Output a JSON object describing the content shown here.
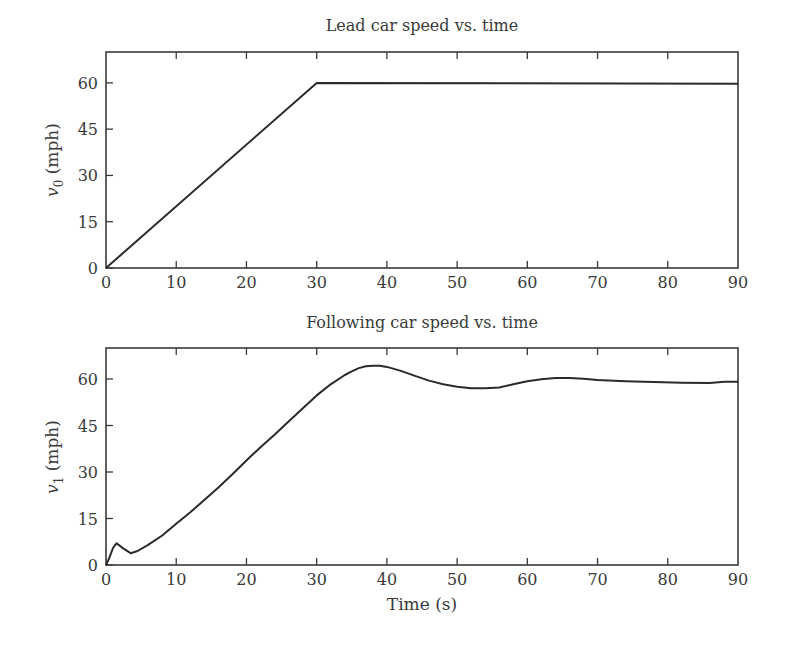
{
  "chart_data": [
    {
      "type": "line",
      "title": "Lead car speed vs. time",
      "xlabel": "",
      "ylabel": "v0 (mph)",
      "ylabel_main": "v",
      "ylabel_sub": "0",
      "ylabel_unit": "(mph)",
      "xlim": [
        0,
        90
      ],
      "ylim": [
        0,
        70
      ],
      "xticks": [
        0,
        10,
        20,
        30,
        40,
        50,
        60,
        70,
        80,
        90
      ],
      "yticks": [
        0,
        15,
        30,
        45,
        60
      ],
      "grid": false,
      "legend": null,
      "series": [
        {
          "name": "v0",
          "x": [
            0,
            30,
            90
          ],
          "y": [
            0,
            60,
            59.7
          ]
        }
      ]
    },
    {
      "type": "line",
      "title": "Following car speed vs. time",
      "xlabel": "Time (s)",
      "ylabel": "v1 (mph)",
      "ylabel_main": "v",
      "ylabel_sub": "1",
      "ylabel_unit": "(mph)",
      "xlim": [
        0,
        90
      ],
      "ylim": [
        0,
        70
      ],
      "xticks": [
        0,
        10,
        20,
        30,
        40,
        50,
        60,
        70,
        80,
        90
      ],
      "yticks": [
        0,
        15,
        30,
        45,
        60
      ],
      "grid": false,
      "legend": null,
      "series": [
        {
          "name": "v1",
          "x": [
            0,
            0.5,
            1.0,
            1.5,
            2.5,
            3.5,
            4.5,
            6,
            8,
            10,
            12,
            14,
            16,
            18,
            20,
            22,
            24,
            26,
            28,
            30,
            32,
            34,
            35,
            36,
            37,
            38,
            39,
            40,
            42,
            44,
            46,
            48,
            50,
            52,
            54,
            56,
            58,
            60,
            62,
            64,
            66,
            68,
            70,
            74,
            78,
            82,
            86,
            88,
            90
          ],
          "y": [
            0,
            2.5,
            5.5,
            7.0,
            5.3,
            3.8,
            4.5,
            6.5,
            9.5,
            13.3,
            17.0,
            21.0,
            25.0,
            29.3,
            33.7,
            38.0,
            42.0,
            46.3,
            50.5,
            54.7,
            58.3,
            61.3,
            62.5,
            63.5,
            64.1,
            64.3,
            64.3,
            63.9,
            62.6,
            61.0,
            59.5,
            58.3,
            57.5,
            57.0,
            57.0,
            57.3,
            58.3,
            59.3,
            59.9,
            60.3,
            60.3,
            60.1,
            59.7,
            59.3,
            59.0,
            58.8,
            58.7,
            59.1,
            59.1
          ]
        }
      ]
    }
  ],
  "labels": {
    "top_title": "Lead car speed vs. time",
    "bottom_title": "Following car speed vs. time",
    "x_axis_title": "Time (s)",
    "top_ylabel_main": "v",
    "top_ylabel_sub": "0",
    "bottom_ylabel_main": "v",
    "bottom_ylabel_sub": "1",
    "ylabel_unit": "(mph)"
  }
}
